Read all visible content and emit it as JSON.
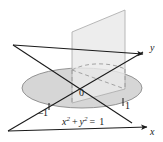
{
  "figure": {
    "kind": "3d-math-diagram",
    "title_visible": false,
    "background_color": "#ffffff"
  },
  "colors": {
    "disk_fill": "#d6d6d6",
    "disk_stroke": "#8a8a8a",
    "plane_fill": "#e9e9e9",
    "plane_stroke": "#b0b0b0",
    "axis_stroke": "#1a1a1a",
    "dashed_stroke": "#9a9a9a",
    "label_color": "#1a1a1a"
  },
  "axes": {
    "x": {
      "label": "x",
      "arrow": true
    },
    "y": {
      "label": "y",
      "arrow": true
    },
    "z": {
      "label": "",
      "arrow": false
    }
  },
  "labels": {
    "origin": "0",
    "tick_negative_one": "–1",
    "tick_positive_one": "1"
  },
  "equation": {
    "lhs_term1_base": "x",
    "lhs_term1_exp": "2",
    "operator": "+",
    "lhs_term2_base": "y",
    "lhs_term2_exp": "2",
    "equals": "=",
    "rhs": "1",
    "plain": "x2 + y2 = 1"
  },
  "shapes": {
    "disk": {
      "name": "unit-circle-disk",
      "cx": 82,
      "cy": 88,
      "rx": 60,
      "ry": 20
    },
    "plane": {
      "name": "vertical-plane"
    },
    "dashed_arc": {
      "name": "hidden-circle-arc"
    }
  }
}
